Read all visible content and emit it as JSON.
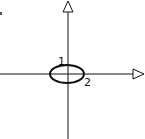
{
  "diagram": {
    "type": "coordinate-axes-with-ellipse",
    "labels": {
      "minor_axis_label": "1",
      "major_axis_label": "2"
    },
    "colors": {
      "stroke": "#111111",
      "background": "#ffffff"
    }
  }
}
